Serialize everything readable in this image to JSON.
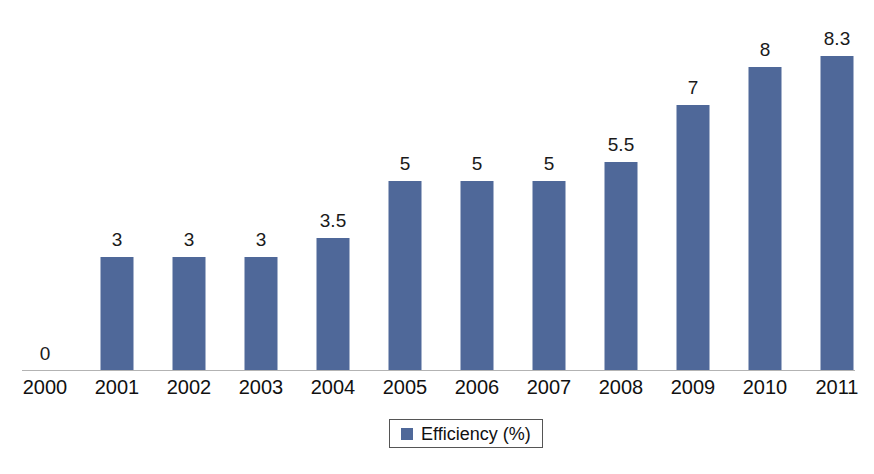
{
  "chart_data": {
    "type": "bar",
    "title": "",
    "subtitle": "",
    "xlabel": "",
    "ylabel": "",
    "categories": [
      "2000",
      "2001",
      "2002",
      "2003",
      "2004",
      "2005",
      "2006",
      "2007",
      "2008",
      "2009",
      "2010",
      "2011"
    ],
    "values": [
      0,
      3,
      3,
      3,
      3.5,
      5,
      5,
      5,
      5.5,
      7,
      8,
      8.3
    ],
    "data_labels": [
      "0",
      "3",
      "3",
      "3",
      "3.5",
      "5",
      "5",
      "5",
      "5.5",
      "7",
      "8",
      "8.3"
    ],
    "series": [
      {
        "name": "Efficiency (%)",
        "color": "#4f6899",
        "values": [
          0,
          3,
          3,
          3,
          3.5,
          5,
          5,
          5,
          5.5,
          7,
          8,
          8.3
        ]
      }
    ],
    "ylim": [
      0,
      8.3
    ],
    "grid": false,
    "legend": {
      "position": "bottom",
      "entries": [
        {
          "label": "Efficiency (%)",
          "color": "#4f6899",
          "marker": "square"
        }
      ]
    },
    "axis": {
      "x_axis_visible": true,
      "y_axis_visible": false,
      "y_tick_labels": []
    }
  },
  "colors": {
    "bar": "#4f6899",
    "axis_line": "#b3b3b3",
    "label_text": "#1a1a1a",
    "background": "#ffffff",
    "legend_border": "#555555"
  }
}
